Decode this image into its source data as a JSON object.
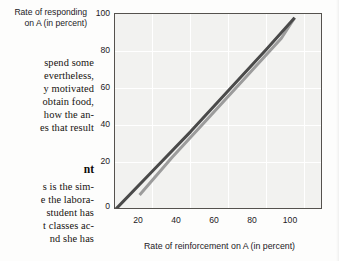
{
  "page": {
    "text_column": {
      "lines": [
        "spend some",
        "evertheless,",
        "y motivated",
        "obtain food,",
        "how the an-",
        "es that result"
      ],
      "heading": "nt",
      "lines_after_heading": [
        "s is the sim-",
        "e the labora-",
        "student has",
        "t classes ac-",
        "nd she has"
      ]
    }
  },
  "chart_data": {
    "type": "line",
    "title": "",
    "xlabel": "Rate of reinforcement on A (in percent)",
    "ylabel_lines": [
      "Rate of responding",
      "on A (in percent)"
    ],
    "xlim": [
      0,
      110
    ],
    "ylim": [
      0,
      105
    ],
    "xticks": [
      20,
      40,
      60,
      80,
      100
    ],
    "yticks": [
      0,
      20,
      40,
      60,
      80,
      100
    ],
    "grid": true,
    "legend": "none",
    "series": [
      {
        "name": "matching-line",
        "color": "#4a4a4a",
        "width": 3.0,
        "x": [
          0,
          20,
          40,
          60,
          80,
          95
        ],
        "y": [
          0,
          21,
          42,
          64,
          86,
          103
        ]
      },
      {
        "name": "undermatching-line",
        "color": "#9c9c9c",
        "width": 3.0,
        "x": [
          13,
          30,
          50,
          70,
          88,
          95
        ],
        "y": [
          8,
          28,
          50,
          72,
          92,
          103
        ]
      }
    ]
  },
  "colors": {
    "plot_background": "#f2f2f0",
    "plot_border": "#55524e",
    "grid": "#ffffff",
    "dark_line": "#4a4a4a",
    "gray_line": "#9c9c9c",
    "text": "#23201e"
  }
}
